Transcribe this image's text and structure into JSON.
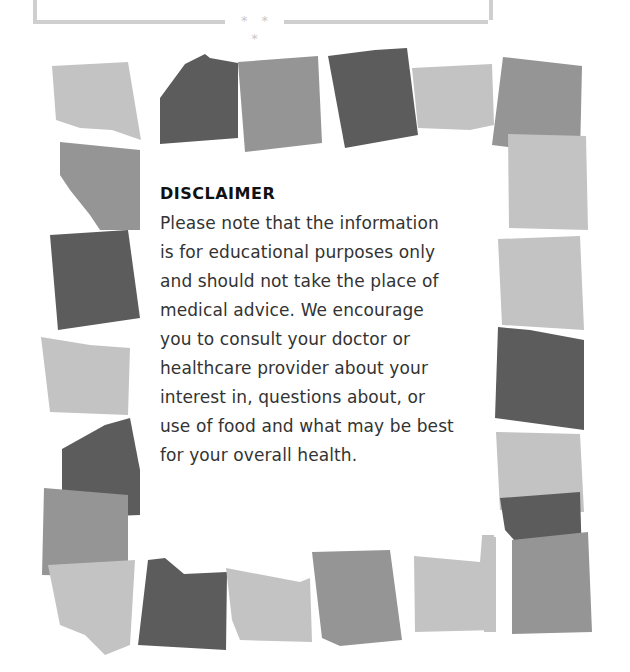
{
  "divider": {
    "ornament": "* * *"
  },
  "disclaimer": {
    "title": "DISCLAIMER",
    "lines": [
      "Please note that the information",
      "is for educational purposes only",
      "and should not take the place of",
      "medical advice. We encourage",
      "you to consult your doctor or",
      "healthcare provider about your",
      "interest in, questions about, or",
      "use of food and what may be best",
      "for your overall health."
    ]
  },
  "colors": {
    "dark": "#5c5c5c",
    "medium": "#959595",
    "light": "#c3c3c3",
    "frame": "#cfcfcf"
  },
  "patches": [
    {
      "tone": "light",
      "points": "52,66 128,62 141,140 112,130 80,128 56,120"
    },
    {
      "tone": "medium",
      "points": "60,142 140,150 140,230 100,230 90,215 70,190 60,175"
    },
    {
      "tone": "dark",
      "points": "160,98 185,64 205,54 210,58 238,63 238,138 160,144"
    },
    {
      "tone": "medium",
      "points": "238,62 318,56 322,143 245,152"
    },
    {
      "tone": "dark",
      "points": "328,56 375,50 407,48 418,135 345,148"
    },
    {
      "tone": "light",
      "points": "412,68 492,64 494,125 470,130 418,128"
    },
    {
      "tone": "medium",
      "points": "503,57 582,66 580,156 492,145"
    },
    {
      "tone": "light",
      "points": "508,134 586,136 588,230 509,228"
    },
    {
      "tone": "dark",
      "points": "50,235 128,230 140,318 58,330"
    },
    {
      "tone": "light",
      "points": "41,337 90,345 130,348 128,415 50,412"
    },
    {
      "tone": "dark",
      "points": "62,449 105,425 130,418 140,470 140,515 62,518"
    },
    {
      "tone": "medium",
      "points": "44,488 128,495 128,577 42,575"
    },
    {
      "tone": "light",
      "points": "48,565 135,560 130,645 105,655 85,635 60,625"
    },
    {
      "tone": "light",
      "points": "498,239 580,236 584,330 502,325"
    },
    {
      "tone": "dark",
      "points": "498,327 530,330 584,340 584,430 495,418"
    },
    {
      "tone": "light",
      "points": "496,432 580,434 584,512 500,510"
    },
    {
      "tone": "dark",
      "points": "500,498 580,492 582,560 530,558 505,530"
    },
    {
      "tone": "medium",
      "points": "512,540 588,532 592,632 512,634"
    },
    {
      "tone": "light",
      "points": "482,535 494,535 496,632 484,632"
    },
    {
      "tone": "dark",
      "points": "148,560 165,558 184,574 227,572 226,650 138,645"
    },
    {
      "tone": "light",
      "points": "226,568 300,582 310,578 312,642 240,640 232,620"
    },
    {
      "tone": "medium",
      "points": "312,552 390,550 402,640 340,646 322,638"
    },
    {
      "tone": "light",
      "points": "414,556 480,562 482,537 496,537 496,630 415,632"
    }
  ]
}
